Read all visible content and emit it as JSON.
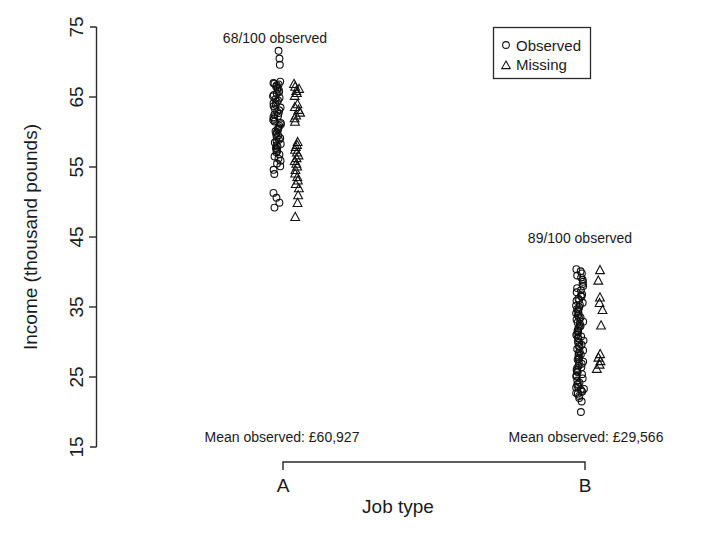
{
  "chart_data": {
    "type": "scatter",
    "title": "",
    "xlabel": "Job type",
    "ylabel": "Income (thousand pounds)",
    "categories": [
      "A",
      "B"
    ],
    "ylim": [
      15,
      75
    ],
    "yticks": [
      15,
      25,
      35,
      45,
      55,
      65,
      75
    ],
    "ytick_labels": [
      "15",
      "25",
      "35",
      "45",
      "55",
      "65",
      "75"
    ],
    "grid": false,
    "legend_position": "top-right",
    "legend": [
      {
        "marker": "circle",
        "label": "Observed"
      },
      {
        "marker": "triangle",
        "label": "Missing"
      }
    ],
    "annotations": [
      {
        "text": "68/100 observed",
        "x_category": "A",
        "y": 74
      },
      {
        "text": "89/100 observed",
        "x_category": "B",
        "y": 46.5
      },
      {
        "text": "Mean observed: £60,927",
        "x_category": "A",
        "y": 16.5
      },
      {
        "text": "Mean observed: £29,566",
        "x_category": "B",
        "y": 16.5
      }
    ],
    "groups": [
      {
        "name": "A",
        "n_total": 100,
        "n_observed": 68,
        "n_missing": 32,
        "mean_observed": 60927,
        "mean_observed_label": "£60,927",
        "observed_values": [
          71.6,
          70.5,
          69.6,
          67.2,
          67.0,
          66.9,
          66.8,
          66.7,
          66.5,
          66.3,
          66.1,
          65.9,
          65.7,
          65.5,
          65.3,
          65.1,
          64.9,
          64.7,
          64.5,
          64.3,
          64.1,
          63.9,
          63.7,
          63.5,
          63.3,
          63.1,
          62.9,
          62.7,
          62.5,
          62.3,
          62.1,
          61.9,
          61.7,
          61.5,
          61.3,
          61.1,
          60.9,
          60.7,
          60.5,
          60.3,
          60.1,
          59.9,
          59.7,
          59.5,
          59.3,
          59.1,
          58.9,
          58.7,
          58.5,
          58.3,
          58.1,
          57.9,
          57.7,
          57.5,
          57.3,
          57.1,
          56.8,
          56.5,
          56.2,
          55.9,
          55.5,
          55.1,
          54.6,
          54.0,
          51.3,
          50.6,
          49.9,
          49.2
        ],
        "missing_values": [
          66.9,
          66.5,
          66.2,
          65.9,
          65.6,
          65.2,
          64.0,
          63.6,
          63.2,
          62.8,
          62.4,
          62.0,
          61.5,
          58.6,
          58.2,
          57.9,
          57.5,
          57.1,
          56.7,
          56.3,
          55.9,
          55.5,
          55.1,
          54.6,
          54.1,
          53.6,
          53.1,
          52.6,
          52.0,
          51.0,
          49.9,
          47.9
        ]
      },
      {
        "name": "B",
        "n_total": 100,
        "n_observed": 89,
        "n_missing": 11,
        "mean_observed": 29566,
        "mean_observed_label": "£29,566",
        "observed_values": [
          40.4,
          40.1,
          39.8,
          39.5,
          39.2,
          38.9,
          38.6,
          38.3,
          38.0,
          37.7,
          37.4,
          37.1,
          36.8,
          36.5,
          36.2,
          35.9,
          35.6,
          35.3,
          35.0,
          34.7,
          34.4,
          34.1,
          33.8,
          33.5,
          33.2,
          32.9,
          32.6,
          32.3,
          32.0,
          31.7,
          31.4,
          31.1,
          30.8,
          30.5,
          30.2,
          29.9,
          29.6,
          29.3,
          29.0,
          28.7,
          28.4,
          28.1,
          27.8,
          27.5,
          27.2,
          26.9,
          26.6,
          26.3,
          26.0,
          25.7,
          25.4,
          25.1,
          24.8,
          24.5,
          24.2,
          23.9,
          23.6,
          23.3,
          23.0,
          22.7,
          30.6,
          30.0,
          29.4,
          28.8,
          28.2,
          27.6,
          27.0,
          26.4,
          25.8,
          25.2,
          33.4,
          32.8,
          32.2,
          31.6,
          31.0,
          34.0,
          34.6,
          35.2,
          36.0,
          36.6,
          24.0,
          23.5,
          23.2,
          22.9,
          22.6,
          22.3,
          22.0,
          21.5,
          20.0
        ],
        "missing_values": [
          40.3,
          38.8,
          36.4,
          35.6,
          34.6,
          32.4,
          28.3,
          27.8,
          27.3,
          26.8,
          26.2
        ]
      }
    ]
  },
  "axis": {
    "y_title": "Income (thousand pounds)",
    "x_title": "Job type",
    "y_ticks": [
      "75",
      "65",
      "55",
      "45",
      "35",
      "25",
      "15"
    ],
    "cat_a": "A",
    "cat_b": "B"
  },
  "legend": {
    "observed_label": "Observed",
    "missing_label": "Missing"
  },
  "annotations": {
    "a_observed": "68/100 observed",
    "b_observed": "89/100 observed",
    "a_mean": "Mean observed: £60,927",
    "b_mean": "Mean observed: £29,566"
  },
  "colors": {
    "ink": "#1a1a1a",
    "marker": "#111111",
    "background": "#ffffff"
  }
}
